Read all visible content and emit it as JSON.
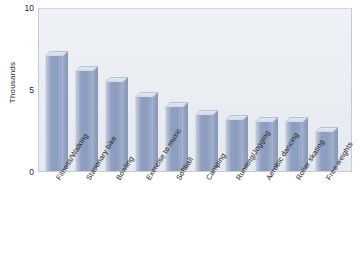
{
  "chart_data": {
    "type": "bar",
    "title": "Men and Women",
    "xlabel": "",
    "ylabel": "Thousands",
    "ylim": [
      0,
      10
    ],
    "yticks": [
      "0",
      "5",
      "10"
    ],
    "grid": false,
    "legend": "none",
    "categories": [
      "Fitness/Walking",
      "Stationary bike",
      "Bowling",
      "Exercise to music",
      "Softball",
      "Camping",
      "Running/Jogging",
      "Aerobic dancing",
      "Roller skating",
      "Free weights"
    ],
    "values": [
      7.0,
      6.1,
      5.4,
      4.5,
      3.9,
      3.4,
      3.0,
      3.0,
      3.0,
      2.4
    ],
    "bars": [
      {
        "label": "Fitness/Walking",
        "value": 7.0
      },
      {
        "label": "Stationary bike",
        "value": 6.1
      },
      {
        "label": "Bowling",
        "value": 5.4
      },
      {
        "label": "Exercise to music",
        "value": 4.5
      },
      {
        "label": "Softball",
        "value": 3.9
      },
      {
        "label": "Camping",
        "value": 3.4
      },
      {
        "label": "Running/Jogging",
        "value": 3.1
      },
      {
        "label": "Aerobic dancing",
        "value": 3.0
      },
      {
        "label": "Roller skating",
        "value": 3.0
      },
      {
        "label": "Free weights",
        "value": 2.4
      }
    ],
    "colors": {
      "bar_front": "#8f9fc0",
      "bar_top": "#dae0ea",
      "bar_side": "#8f9fc0",
      "plot_background": "#e9edf2",
      "plot_border": "#c7ccd4",
      "text": "#1d1d1d",
      "page_background": "#ffffff"
    }
  }
}
